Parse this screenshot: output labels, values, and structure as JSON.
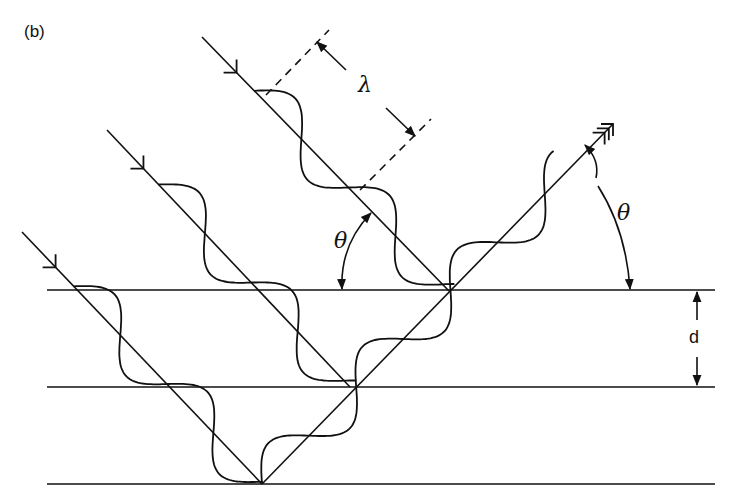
{
  "figure": {
    "panel_label": "(b)",
    "labels": {
      "wavelength": "λ",
      "angle_incident": "θ",
      "angle_reflected": "θ",
      "spacing": "d"
    },
    "colors": {
      "ink": "#111111",
      "background": "#ffffff"
    }
  },
  "geometry": {
    "planes_y": [
      290,
      387,
      484
    ],
    "planes_x": [
      47,
      715
    ],
    "incident_rays": [
      {
        "start": [
          202,
          37
        ],
        "end": [
          449,
          291
        ],
        "arrow_at": 0.14
      },
      {
        "start": [
          107,
          130
        ],
        "end": [
          350,
          387
        ],
        "arrow_at": 0.15
      },
      {
        "start": [
          22,
          232
        ],
        "end": [
          262,
          484
        ],
        "arrow_at": 0.14
      }
    ],
    "reflected_ray": {
      "start": [
        262,
        484
      ],
      "end": [
        613,
        124
      ]
    },
    "wave": {
      "amplitude": 24,
      "wavelength": 135
    },
    "wavelength_marker": {
      "dash1": [
        [
          266,
          95
        ],
        [
          329,
          30
        ]
      ],
      "dash2": [
        [
          360,
          190
        ],
        [
          431,
          119
        ]
      ],
      "arrow": [
        [
          317,
          42
        ],
        [
          415,
          136
        ]
      ]
    }
  }
}
